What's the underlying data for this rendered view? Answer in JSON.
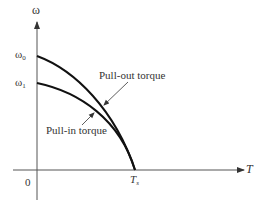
{
  "diagram": {
    "type": "speed-torque characteristic",
    "axes": {
      "y_label": "ω",
      "x_label": "T",
      "origin_label": "0"
    },
    "y_ticks": [
      {
        "symbol": "ω",
        "subscript": "0"
      },
      {
        "symbol": "ω",
        "subscript": "1"
      }
    ],
    "x_ticks": [
      {
        "symbol": "T",
        "subscript": "s"
      }
    ],
    "curves": [
      {
        "name": "Pull-out torque",
        "start": "ω0",
        "end": "Ts"
      },
      {
        "name": "Pull-in torque",
        "start": "ω1",
        "end": "Ts"
      }
    ],
    "annotations": {
      "pull_out": "Pull-out torque",
      "pull_in": "Pull-in torque"
    },
    "colors": {
      "curve": "#111111",
      "axis": "#555555",
      "text": "#333333"
    }
  }
}
